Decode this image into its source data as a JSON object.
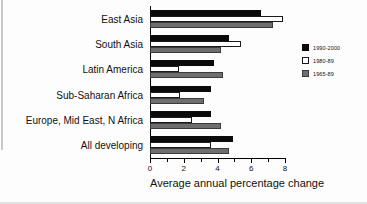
{
  "chart_data": {
    "type": "bar",
    "orientation": "horizontal",
    "title": "",
    "xlabel": "Average annual percentage change",
    "ylabel": "",
    "xlim": [
      0,
      8
    ],
    "xticks": [
      0,
      2,
      4,
      6,
      8
    ],
    "xtick_labels": [
      "0",
      "2",
      "4",
      "6",
      "8"
    ],
    "grid": false,
    "legend_position": "right",
    "categories": [
      "East Asia",
      "South Asia",
      "Latin America",
      "Sub-Saharan Africa",
      "Europe, Mid East, N Africa",
      "All developing"
    ],
    "series": [
      {
        "name": "1990-2000",
        "color": "#0a0a0a",
        "values": [
          6.6,
          4.7,
          3.8,
          3.6,
          3.6,
          4.9
        ]
      },
      {
        "name": "1980-89",
        "color": "#ffffff",
        "values": [
          7.9,
          5.4,
          1.7,
          1.8,
          2.5,
          3.6
        ]
      },
      {
        "name": "1965-89",
        "color": "#6e6e6e",
        "values": [
          7.3,
          4.2,
          4.3,
          3.2,
          4.2,
          4.7
        ]
      }
    ]
  },
  "legend": {
    "entries": [
      {
        "label": "1990-2000",
        "swatch": "s1990"
      },
      {
        "label": "1980-89",
        "swatch": "s1980"
      },
      {
        "label": "1965-89",
        "swatch": "s1965"
      }
    ]
  },
  "axis": {
    "title": "Average annual percentage change",
    "tick_labels": [
      "0",
      "2",
      "4",
      "6",
      "8"
    ]
  },
  "categories": {
    "labels": [
      "East Asia",
      "South Asia",
      "Latin America",
      "Sub-Saharan Africa",
      "Europe, Mid East, N Africa",
      "All developing"
    ]
  }
}
